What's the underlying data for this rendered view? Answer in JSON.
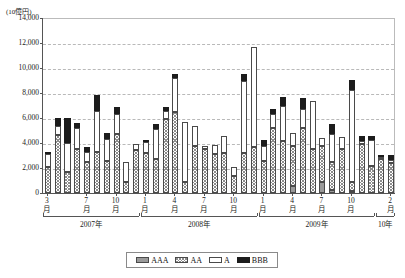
{
  "chart_data": {
    "type": "bar",
    "stacked": true,
    "title": "",
    "unit_label": "(10億円)",
    "ylabel": "",
    "xlabel": "",
    "ylim": [
      0,
      14000
    ],
    "ytick_values": [
      0,
      2000,
      4000,
      6000,
      8000,
      10000,
      12000,
      14000
    ],
    "ytick_labels": [
      "0",
      "2,000",
      "4,000",
      "6,000",
      "8,000",
      "10,000",
      "12,000",
      "14,000"
    ],
    "grid": true,
    "legend_position": "bottom",
    "month_suffix": "月",
    "categories": [
      "3",
      "4",
      "5",
      "6",
      "7",
      "8",
      "9",
      "10",
      "11",
      "12",
      "1",
      "2",
      "3",
      "4",
      "5",
      "6",
      "7",
      "8",
      "9",
      "10",
      "11",
      "12",
      "1",
      "2",
      "3",
      "4",
      "5",
      "6",
      "7",
      "8",
      "9",
      "10",
      "11",
      "12",
      "1",
      "2"
    ],
    "xtick_labels": [
      {
        "index": 0,
        "label": "3"
      },
      {
        "index": 4,
        "label": "7"
      },
      {
        "index": 7,
        "label": "10"
      },
      {
        "index": 10,
        "label": "1"
      },
      {
        "index": 13,
        "label": "4"
      },
      {
        "index": 16,
        "label": "7"
      },
      {
        "index": 19,
        "label": "10"
      },
      {
        "index": 22,
        "label": "1"
      },
      {
        "index": 25,
        "label": "4"
      },
      {
        "index": 28,
        "label": "7"
      },
      {
        "index": 31,
        "label": "10"
      },
      {
        "index": 35,
        "label": "2"
      }
    ],
    "year_groups": [
      {
        "label": "2007年",
        "start_index": 0,
        "end_index": 9
      },
      {
        "label": "2008年",
        "start_index": 10,
        "end_index": 21
      },
      {
        "label": "2009年",
        "start_index": 22,
        "end_index": 33
      },
      {
        "label": "10年",
        "start_index": 34,
        "end_index": 35
      }
    ],
    "series": [
      {
        "name": "AAA",
        "color": "#9a9a9a",
        "pattern": "solid-gray",
        "values": [
          0,
          0,
          0,
          0,
          0,
          0,
          0,
          0,
          0,
          0,
          0,
          0,
          0,
          0,
          0,
          0,
          0,
          0,
          0,
          0,
          0,
          0,
          0,
          0,
          0,
          600,
          0,
          0,
          900,
          250,
          0,
          200,
          0,
          0,
          0,
          0
        ]
      },
      {
        "name": "AA",
        "color": "#ffffff",
        "pattern": "crosshatch",
        "values": [
          2050,
          4650,
          1650,
          3500,
          2500,
          3300,
          2600,
          4700,
          900,
          3450,
          3200,
          2700,
          5900,
          6500,
          850,
          3800,
          3500,
          3150,
          3200,
          1350,
          3200,
          3700,
          2600,
          5200,
          4150,
          3150,
          5200,
          3550,
          2900,
          2200,
          3500,
          700,
          3900,
          2150,
          2750,
          2400
        ]
      },
      {
        "name": "A",
        "color": "#ffffff",
        "pattern": "open",
        "values": [
          1050,
          750,
          2350,
          1700,
          800,
          3300,
          1700,
          1600,
          1550,
          500,
          850,
          2450,
          700,
          2700,
          4800,
          1600,
          300,
          700,
          1400,
          750,
          5750,
          7950,
          1150,
          1100,
          2850,
          1050,
          1500,
          3800,
          600,
          2300,
          950,
          7350,
          250,
          2100,
          150,
          250
        ]
      },
      {
        "name": "BBB",
        "color": "#1c1c1c",
        "pattern": "solid-black",
        "values": [
          200,
          600,
          2000,
          400,
          400,
          1250,
          500,
          600,
          0,
          0,
          200,
          400,
          300,
          350,
          0,
          0,
          0,
          0,
          0,
          0,
          550,
          0,
          500,
          400,
          700,
          0,
          900,
          0,
          0,
          750,
          0,
          800,
          400,
          300,
          150,
          400
        ]
      }
    ],
    "legend": [
      {
        "label": "AAA",
        "swatch": "solid-gray"
      },
      {
        "label": "AA",
        "swatch": "crosshatch"
      },
      {
        "label": "A",
        "swatch": "open"
      },
      {
        "label": "BBB",
        "swatch": "solid-black"
      }
    ]
  }
}
